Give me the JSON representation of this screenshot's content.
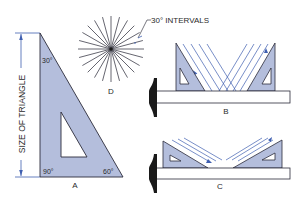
{
  "colors": {
    "triangle_fill": "#b4bedc",
    "outline": "#2b2b3a",
    "blue_line": "#3f5fb0",
    "tsquare_fill": "#ffffff",
    "head_fill": "#1a1a1a",
    "text": "#2a2a2a"
  },
  "figure_a": {
    "label": "A",
    "angle_top": "30°",
    "angle_bottom_left": "90°",
    "angle_bottom_right": "60°",
    "dimension_label": "SIZE OF TRIANGLE"
  },
  "figure_b": {
    "label": "B"
  },
  "figure_c": {
    "label": "C"
  },
  "figure_d": {
    "label": "D",
    "annotation": "30° INTERVALS",
    "ray_count": 12,
    "interval_degrees": 15
  }
}
